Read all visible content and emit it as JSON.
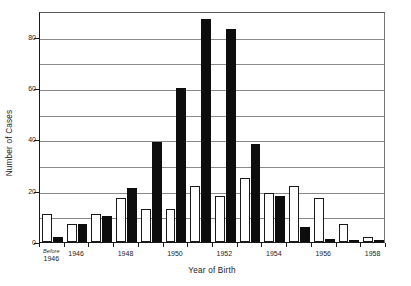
{
  "chart_data": {
    "type": "bar",
    "title": "",
    "xlabel": "Year of Birth",
    "ylabel": "Number of Cases",
    "ylim": [
      0,
      90
    ],
    "yticks": [
      0,
      20,
      40,
      60,
      80
    ],
    "ytick_labels": [
      "0",
      "20",
      "40",
      "60",
      "80"
    ],
    "gridlines": [
      10,
      20,
      30,
      40,
      50,
      60,
      70,
      80
    ],
    "grid": true,
    "legend": null,
    "categories": [
      "Before 1946",
      "1946",
      "1947",
      "1948",
      "1949",
      "1950",
      "1951",
      "1952",
      "1953",
      "1954",
      "1955",
      "1956",
      "1957",
      "1958"
    ],
    "xtick_labels": [
      {
        "line1": "Before",
        "line2": "1946"
      },
      {
        "line1": "",
        "line2": "1946"
      },
      {
        "line1": "",
        "line2": "1948"
      },
      {
        "line1": "",
        "line2": "1950"
      },
      {
        "line1": "",
        "line2": "1952"
      },
      {
        "line1": "",
        "line2": "1954"
      },
      {
        "line1": "",
        "line2": "1956"
      },
      {
        "line1": "",
        "line2": "1958"
      }
    ],
    "xtick_category_index": [
      0,
      1,
      3,
      5,
      7,
      9,
      11,
      13
    ],
    "series": [
      {
        "name": "first half",
        "style": "open",
        "values": [
          11,
          7,
          11,
          17,
          13,
          13,
          22,
          18,
          25,
          19,
          22,
          17,
          7,
          2
        ]
      },
      {
        "name": "second half",
        "style": "filled",
        "values": [
          2,
          7,
          10,
          21,
          39,
          60,
          87,
          83,
          38,
          18,
          6,
          1,
          0.6,
          0.5
        ]
      }
    ],
    "bar_colors": {
      "open_fill": "#ffffff",
      "open_stroke": "#1a1a1a",
      "filled": "#0d0d0d"
    }
  }
}
